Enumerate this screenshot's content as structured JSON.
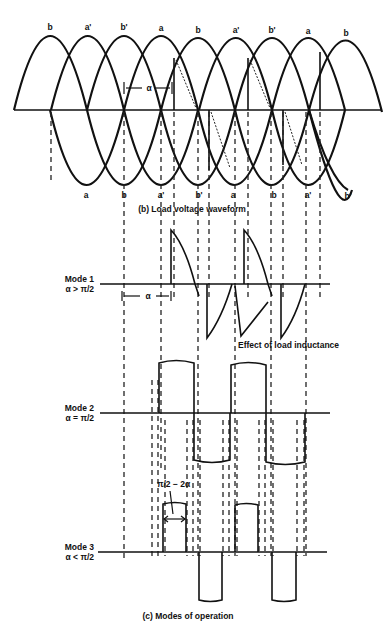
{
  "figure": {
    "top_phase_labels": [
      "b",
      "a'",
      "b'",
      "a",
      "b",
      "a'",
      "b'",
      "a",
      "b"
    ],
    "bottom_phase_labels": [
      "a",
      "b",
      "a'",
      "b'",
      "a",
      "b",
      "a'",
      "b'"
    ],
    "alpha_label": "α",
    "caption_b": "(b) Load voltage waveform",
    "caption_c": "(c) Modes of operation",
    "modes": [
      {
        "name": "Mode 1",
        "condition": "α > π/2"
      },
      {
        "name": "Mode 2",
        "condition": "α = π/2"
      },
      {
        "name": "Mode 3",
        "condition": "α < π/2"
      }
    ],
    "mode1_alpha_label": "α",
    "mode1_annotation": "Effect of load inductance",
    "mode3_annotation": "π/2 − 2α"
  }
}
